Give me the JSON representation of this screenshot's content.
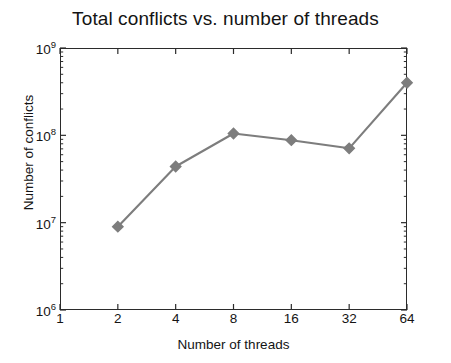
{
  "chart_data": {
    "type": "line",
    "title": "Total conflicts vs. number of threads",
    "xlabel": "Number of threads",
    "ylabel": "Number of conflicts",
    "xscale": "log2",
    "yscale": "log10",
    "xlim": [
      1,
      64
    ],
    "ylim": [
      1000000,
      1000000000
    ],
    "grid": false,
    "legend": null,
    "xticks": [
      {
        "value": 1,
        "label": "1"
      },
      {
        "value": 2,
        "label": "2"
      },
      {
        "value": 4,
        "label": "4"
      },
      {
        "value": 8,
        "label": "8"
      },
      {
        "value": 16,
        "label": "16"
      },
      {
        "value": 32,
        "label": "32"
      },
      {
        "value": 64,
        "label": "64"
      }
    ],
    "yticks": [
      {
        "value": 1000000,
        "mantissa": "10",
        "exponent": "6"
      },
      {
        "value": 10000000,
        "mantissa": "10",
        "exponent": "7"
      },
      {
        "value": 100000000,
        "mantissa": "10",
        "exponent": "8"
      },
      {
        "value": 1000000000,
        "mantissa": "10",
        "exponent": "9"
      }
    ],
    "series": [
      {
        "name": "Total conflicts",
        "marker": "diamond",
        "color": "#7d7d7d",
        "x": [
          2,
          4,
          8,
          16,
          32,
          64
        ],
        "y": [
          9000000,
          44000000,
          105000000,
          88000000,
          71000000,
          400000000
        ]
      }
    ]
  },
  "colors": {
    "line": "#7d7d7d",
    "marker": "#7d7d7d",
    "axis": "#2b2b2b",
    "text": "#141414",
    "background": "#ffffff"
  }
}
